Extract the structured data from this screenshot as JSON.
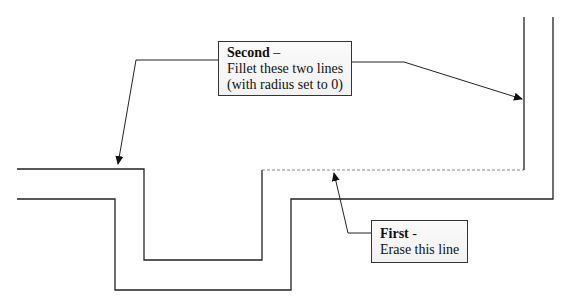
{
  "callouts": {
    "second": {
      "heading": "Second",
      "dash": " –",
      "lines": [
        "Fillet these two lines",
        "(with radius set to 0)"
      ]
    },
    "first": {
      "heading": "First",
      "dash": " -",
      "lines": [
        "Erase this line"
      ]
    }
  },
  "colors": {
    "line": "#222222",
    "dashed_line": "#888888"
  }
}
